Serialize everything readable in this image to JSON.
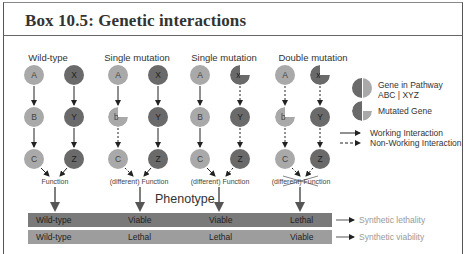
{
  "box": {
    "title": "Box 10.5: Genetic interactions"
  },
  "columns": [
    {
      "label": "Wild-type",
      "left_nodes": [
        "A",
        "B",
        "C"
      ],
      "right_nodes": [
        "X",
        "Y",
        "Z"
      ],
      "left_mutated": [
        false,
        false,
        false
      ],
      "right_mutated": [
        false,
        false,
        false
      ],
      "left_arrows": [
        "working",
        "working"
      ],
      "right_arrows": [
        "working",
        "working"
      ],
      "function_label": "Function",
      "function_crossed": false
    },
    {
      "label": "Single mutation",
      "left_nodes": [
        "A",
        "b*",
        "C"
      ],
      "right_nodes": [
        "X",
        "Y",
        "Z"
      ],
      "left_mutated": [
        false,
        true,
        false
      ],
      "right_mutated": [
        false,
        false,
        false
      ],
      "left_arrows": [
        "working",
        "non-working"
      ],
      "right_arrows": [
        "working",
        "working"
      ],
      "function_label": "(different) Function",
      "function_crossed": false
    },
    {
      "label": "Single mutation",
      "left_nodes": [
        "A",
        "B",
        "C"
      ],
      "right_nodes": [
        "x*",
        "Y",
        "Z"
      ],
      "left_mutated": [
        false,
        false,
        false
      ],
      "right_mutated": [
        true,
        false,
        false
      ],
      "left_arrows": [
        "working",
        "working"
      ],
      "right_arrows": [
        "non-working",
        "non-working"
      ],
      "function_label": "(different) Function",
      "function_crossed": false
    },
    {
      "label": "Double mutation",
      "left_nodes": [
        "A",
        "b*",
        "C"
      ],
      "right_nodes": [
        "x*",
        "Y",
        "Z"
      ],
      "left_mutated": [
        false,
        true,
        false
      ],
      "right_mutated": [
        true,
        false,
        false
      ],
      "left_arrows": [
        "non-working",
        "non-working"
      ],
      "right_arrows": [
        "non-working",
        "non-working"
      ],
      "function_label": "(different) Function",
      "function_crossed": true
    }
  ],
  "legend": {
    "gene_in_pathway_line1": "Gene in Pathway",
    "gene_in_pathway_line2": "ABC | XYZ",
    "mutated_gene": "Mutated Gene",
    "working_interaction": "Working Interaction",
    "non_working_interaction": "Non-Working Interaction"
  },
  "phenotype": {
    "title": "Phenotype",
    "rows": [
      {
        "values": [
          "Wild-type",
          "Viable",
          "Viable",
          "Lethal"
        ],
        "outcome": "Synthetic lethality"
      },
      {
        "values": [
          "Wild-type",
          "Lethal",
          "Lethal",
          "Viable"
        ],
        "outcome": "Synthetic viability"
      }
    ]
  },
  "colors": {
    "gene_abc": "#a9a9a9",
    "gene_xyz": "#6a6a6a",
    "bar_top": "#7a7a7a",
    "bar_bottom": "#9d9d9d",
    "outcome_text": "#999999"
  }
}
